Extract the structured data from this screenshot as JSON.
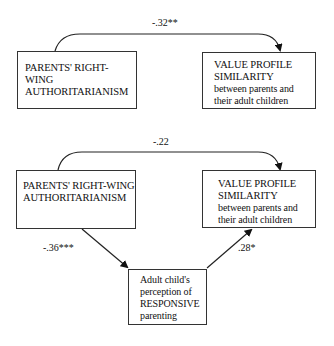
{
  "diagram": {
    "model_a": {
      "predictor": {
        "line1": "PARENTS' RIGHT-WING",
        "line2": "AUTHORITARIANISM"
      },
      "outcome": {
        "line1": "VALUE PROFILE",
        "line2": "SIMILARITY",
        "line3": "between parents and",
        "line4": "their adult children"
      },
      "direct_path": {
        "coefficient": "-.32**"
      }
    },
    "model_b": {
      "predictor": {
        "line1": "PARENTS' RIGHT-WING",
        "line2": "AUTHORITARIANISM"
      },
      "outcome": {
        "line1": "VALUE PROFILE",
        "line2": "SIMILARITY",
        "line3": "between parents and",
        "line4": "their adult children"
      },
      "mediator": {
        "line1": "Adult child's",
        "line2": "perception of",
        "line3": "RESPONSIVE",
        "line4": "parenting"
      },
      "direct_path": {
        "coefficient": "-.22"
      },
      "path_a": {
        "coefficient": "-.36***"
      },
      "path_b": {
        "coefficient": ".28*"
      }
    },
    "colors": {
      "line": "#222222",
      "border": "#333333",
      "background": "#ffffff"
    }
  }
}
